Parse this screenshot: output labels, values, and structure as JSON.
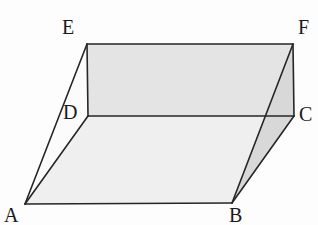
{
  "figure": {
    "background_color": "#fdfdfd",
    "stroke_color": "#262626",
    "stroke_width": 1.6,
    "label_color": "#1a1a1a",
    "label_font_size": 20,
    "vertices": [
      {
        "id": "A",
        "label": "A",
        "x": 25,
        "y": 204,
        "label_x": 4,
        "label_y": 205
      },
      {
        "id": "B",
        "label": "B",
        "x": 232,
        "y": 203,
        "label_x": 229,
        "label_y": 205
      },
      {
        "id": "C",
        "label": "C",
        "x": 294,
        "y": 116,
        "label_x": 299,
        "label_y": 104
      },
      {
        "id": "D",
        "label": "D",
        "x": 88,
        "y": 116,
        "label_x": 63,
        "label_y": 102
      },
      {
        "id": "E",
        "label": "E",
        "x": 87,
        "y": 44,
        "label_x": 62,
        "label_y": 17
      },
      {
        "id": "F",
        "label": "F",
        "x": 293,
        "y": 44,
        "label_x": 298,
        "label_y": 17
      }
    ],
    "faces": [
      {
        "id": "bottom-face",
        "name": "face-ABCD",
        "points": "25,204 232,203 294,116 88,116",
        "fill": "#efefef"
      },
      {
        "id": "top-face",
        "name": "face-DCFE",
        "points": "88,116 294,116 293,44 87,44",
        "fill": "#e4e4e4"
      },
      {
        "id": "right-face",
        "name": "face-BCF",
        "points": "232,203 294,116 293,44",
        "fill": "#c9c9c9"
      },
      {
        "id": "top-right-wedge",
        "name": "face-top-right-wedge",
        "points": "293,44 294,116 232,203",
        "fill": "#d8d8d8"
      },
      {
        "id": "left-face",
        "name": "face-ADE",
        "points": "25,204 88,116 87,44",
        "fill": "#fbfbfb"
      }
    ],
    "edges": [
      {
        "id": "AB",
        "name": "edge-ab",
        "x1": 25,
        "y1": 204,
        "x2": 232,
        "y2": 203
      },
      {
        "id": "BC",
        "name": "edge-bc",
        "x1": 232,
        "y1": 203,
        "x2": 294,
        "y2": 116
      },
      {
        "id": "CD",
        "name": "edge-cd",
        "x1": 294,
        "y1": 116,
        "x2": 88,
        "y2": 116
      },
      {
        "id": "DA",
        "name": "edge-da",
        "x1": 88,
        "y1": 116,
        "x2": 25,
        "y2": 204
      },
      {
        "id": "EF",
        "name": "edge-ef",
        "x1": 87,
        "y1": 44,
        "x2": 293,
        "y2": 44
      },
      {
        "id": "FC",
        "name": "edge-fc",
        "x1": 293,
        "y1": 44,
        "x2": 294,
        "y2": 116
      },
      {
        "id": "DE",
        "name": "edge-de",
        "x1": 88,
        "y1": 116,
        "x2": 87,
        "y2": 44
      },
      {
        "id": "AE",
        "name": "edge-ae",
        "x1": 25,
        "y1": 204,
        "x2": 87,
        "y2": 44
      },
      {
        "id": "BF",
        "name": "edge-bf",
        "x1": 232,
        "y1": 203,
        "x2": 293,
        "y2": 44
      }
    ]
  }
}
